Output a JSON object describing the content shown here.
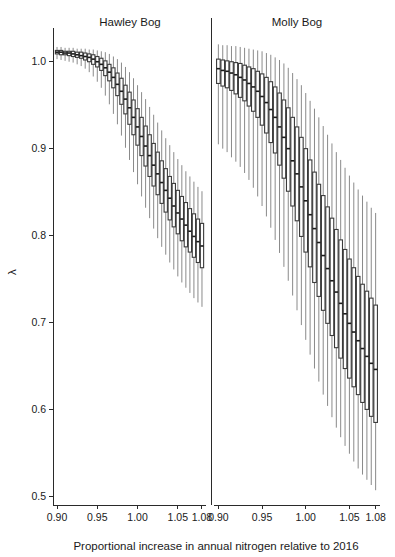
{
  "chart_data": {
    "type": "box",
    "title": "",
    "xlabel": "Proportional increase in annual nitrogen relative to 2016",
    "ylabel": "λ",
    "xlim": [
      0.895,
      1.085
    ],
    "ylim": [
      0.49,
      1.025
    ],
    "xticks": [
      0.9,
      0.95,
      1.0,
      1.05,
      1.08
    ],
    "xticklabels": [
      "0.90",
      "0.95",
      "1.00",
      "1.05",
      "1.08"
    ],
    "yticks": [
      0.5,
      0.6,
      0.7,
      0.8,
      0.9,
      1.0
    ],
    "yticklabels": [
      "0.5",
      "0.6",
      "0.7",
      "0.8",
      "0.9",
      "1.0"
    ],
    "grid": false,
    "legend": "none",
    "panels": [
      {
        "name": "Hawley Bog",
        "x": [
          0.9,
          0.905,
          0.91,
          0.915,
          0.92,
          0.925,
          0.93,
          0.935,
          0.94,
          0.945,
          0.95,
          0.955,
          0.96,
          0.965,
          0.97,
          0.975,
          0.98,
          0.985,
          0.99,
          0.995,
          1.0,
          1.005,
          1.01,
          1.015,
          1.02,
          1.025,
          1.03,
          1.035,
          1.04,
          1.045,
          1.05,
          1.055,
          1.06,
          1.065,
          1.07,
          1.075,
          1.08
        ],
        "boxes": [
          {
            "whisker_low": 1.003,
            "q1": 1.009,
            "median": 1.011,
            "q3": 1.013,
            "whisker_high": 1.017
          },
          {
            "whisker_low": 1.002,
            "q1": 1.008,
            "median": 1.011,
            "q3": 1.013,
            "whisker_high": 1.017
          },
          {
            "whisker_low": 1.001,
            "q1": 1.008,
            "median": 1.01,
            "q3": 1.012,
            "whisker_high": 1.016
          },
          {
            "whisker_low": 1.0,
            "q1": 1.007,
            "median": 1.01,
            "q3": 1.012,
            "whisker_high": 1.016
          },
          {
            "whisker_low": 0.999,
            "q1": 1.006,
            "median": 1.009,
            "q3": 1.012,
            "whisker_high": 1.016
          },
          {
            "whisker_low": 0.997,
            "q1": 1.005,
            "median": 1.008,
            "q3": 1.011,
            "whisker_high": 1.015
          },
          {
            "whisker_low": 0.995,
            "q1": 1.004,
            "median": 1.007,
            "q3": 1.011,
            "whisker_high": 1.015
          },
          {
            "whisker_low": 0.992,
            "q1": 1.002,
            "median": 1.006,
            "q3": 1.01,
            "whisker_high": 1.015
          },
          {
            "whisker_low": 0.988,
            "q1": 1.0,
            "median": 1.005,
            "q3": 1.009,
            "whisker_high": 1.014
          },
          {
            "whisker_low": 0.983,
            "q1": 0.997,
            "median": 1.003,
            "q3": 1.008,
            "whisker_high": 1.014
          },
          {
            "whisker_low": 0.977,
            "q1": 0.994,
            "median": 1.0,
            "q3": 1.006,
            "whisker_high": 1.013
          },
          {
            "whisker_low": 0.97,
            "q1": 0.99,
            "median": 0.997,
            "q3": 1.004,
            "whisker_high": 1.012
          },
          {
            "whisker_low": 0.961,
            "q1": 0.984,
            "median": 0.993,
            "q3": 1.001,
            "whisker_high": 1.011
          },
          {
            "whisker_low": 0.951,
            "q1": 0.978,
            "median": 0.988,
            "q3": 0.997,
            "whisker_high": 1.009
          },
          {
            "whisker_low": 0.94,
            "q1": 0.97,
            "median": 0.982,
            "q3": 0.993,
            "whisker_high": 1.006
          },
          {
            "whisker_low": 0.928,
            "q1": 0.961,
            "median": 0.974,
            "q3": 0.987,
            "whisker_high": 1.003
          },
          {
            "whisker_low": 0.915,
            "q1": 0.951,
            "median": 0.966,
            "q3": 0.981,
            "whisker_high": 0.999
          },
          {
            "whisker_low": 0.901,
            "q1": 0.94,
            "median": 0.957,
            "q3": 0.973,
            "whisker_high": 0.994
          },
          {
            "whisker_low": 0.887,
            "q1": 0.928,
            "median": 0.947,
            "q3": 0.965,
            "whisker_high": 0.988
          },
          {
            "whisker_low": 0.873,
            "q1": 0.916,
            "median": 0.936,
            "q3": 0.956,
            "whisker_high": 0.981
          },
          {
            "whisker_low": 0.859,
            "q1": 0.904,
            "median": 0.925,
            "q3": 0.946,
            "whisker_high": 0.973
          },
          {
            "whisker_low": 0.845,
            "q1": 0.892,
            "median": 0.914,
            "q3": 0.936,
            "whisker_high": 0.965
          },
          {
            "whisker_low": 0.832,
            "q1": 0.88,
            "median": 0.903,
            "q3": 0.926,
            "whisker_high": 0.957
          },
          {
            "whisker_low": 0.82,
            "q1": 0.868,
            "median": 0.892,
            "q3": 0.916,
            "whisker_high": 0.948
          },
          {
            "whisker_low": 0.808,
            "q1": 0.857,
            "median": 0.881,
            "q3": 0.906,
            "whisker_high": 0.939
          },
          {
            "whisker_low": 0.797,
            "q1": 0.847,
            "median": 0.871,
            "q3": 0.896,
            "whisker_high": 0.93
          },
          {
            "whisker_low": 0.787,
            "q1": 0.837,
            "median": 0.861,
            "q3": 0.886,
            "whisker_high": 0.921
          },
          {
            "whisker_low": 0.778,
            "q1": 0.827,
            "median": 0.852,
            "q3": 0.877,
            "whisker_high": 0.912
          },
          {
            "whisker_low": 0.769,
            "q1": 0.818,
            "median": 0.843,
            "q3": 0.868,
            "whisker_high": 0.904
          },
          {
            "whisker_low": 0.761,
            "q1": 0.81,
            "median": 0.834,
            "q3": 0.86,
            "whisker_high": 0.896
          },
          {
            "whisker_low": 0.753,
            "q1": 0.802,
            "median": 0.826,
            "q3": 0.852,
            "whisker_high": 0.888
          },
          {
            "whisker_low": 0.746,
            "q1": 0.794,
            "median": 0.819,
            "q3": 0.845,
            "whisker_high": 0.881
          },
          {
            "whisker_low": 0.74,
            "q1": 0.787,
            "median": 0.812,
            "q3": 0.838,
            "whisker_high": 0.874
          },
          {
            "whisker_low": 0.734,
            "q1": 0.781,
            "median": 0.805,
            "q3": 0.831,
            "whisker_high": 0.868
          },
          {
            "whisker_low": 0.728,
            "q1": 0.775,
            "median": 0.799,
            "q3": 0.825,
            "whisker_high": 0.862
          },
          {
            "whisker_low": 0.723,
            "q1": 0.769,
            "median": 0.793,
            "q3": 0.819,
            "whisker_high": 0.856
          },
          {
            "whisker_low": 0.718,
            "q1": 0.763,
            "median": 0.788,
            "q3": 0.814,
            "whisker_high": 0.851
          }
        ]
      },
      {
        "name": "Molly Bog",
        "x": [
          0.9,
          0.905,
          0.91,
          0.915,
          0.92,
          0.925,
          0.93,
          0.935,
          0.94,
          0.945,
          0.95,
          0.955,
          0.96,
          0.965,
          0.97,
          0.975,
          0.98,
          0.985,
          0.99,
          0.995,
          1.0,
          1.005,
          1.01,
          1.015,
          1.02,
          1.025,
          1.03,
          1.035,
          1.04,
          1.045,
          1.05,
          1.055,
          1.06,
          1.065,
          1.07,
          1.075,
          1.08
        ],
        "boxes": [
          {
            "whisker_low": 0.905,
            "q1": 0.975,
            "median": 0.992,
            "q3": 1.003,
            "whisker_high": 1.02
          },
          {
            "whisker_low": 0.9,
            "q1": 0.972,
            "median": 0.99,
            "q3": 1.002,
            "whisker_high": 1.019
          },
          {
            "whisker_low": 0.896,
            "q1": 0.97,
            "median": 0.989,
            "q3": 1.001,
            "whisker_high": 1.019
          },
          {
            "whisker_low": 0.89,
            "q1": 0.967,
            "median": 0.987,
            "q3": 1.0,
            "whisker_high": 1.018
          },
          {
            "whisker_low": 0.885,
            "q1": 0.963,
            "median": 0.985,
            "q3": 0.999,
            "whisker_high": 1.018
          },
          {
            "whisker_low": 0.879,
            "q1": 0.959,
            "median": 0.982,
            "q3": 0.998,
            "whisker_high": 1.017
          },
          {
            "whisker_low": 0.872,
            "q1": 0.955,
            "median": 0.979,
            "q3": 0.996,
            "whisker_high": 1.016
          },
          {
            "whisker_low": 0.864,
            "q1": 0.949,
            "median": 0.975,
            "q3": 0.994,
            "whisker_high": 1.015
          },
          {
            "whisker_low": 0.855,
            "q1": 0.943,
            "median": 0.971,
            "q3": 0.992,
            "whisker_high": 1.014
          },
          {
            "whisker_low": 0.845,
            "q1": 0.936,
            "median": 0.966,
            "q3": 0.989,
            "whisker_high": 1.013
          },
          {
            "whisker_low": 0.834,
            "q1": 0.927,
            "median": 0.96,
            "q3": 0.986,
            "whisker_high": 1.012
          },
          {
            "whisker_low": 0.822,
            "q1": 0.918,
            "median": 0.953,
            "q3": 0.982,
            "whisker_high": 1.01
          },
          {
            "whisker_low": 0.809,
            "q1": 0.907,
            "median": 0.945,
            "q3": 0.977,
            "whisker_high": 1.008
          },
          {
            "whisker_low": 0.795,
            "q1": 0.895,
            "median": 0.936,
            "q3": 0.971,
            "whisker_high": 1.005
          },
          {
            "whisker_low": 0.78,
            "q1": 0.881,
            "median": 0.925,
            "q3": 0.964,
            "whisker_high": 1.002
          },
          {
            "whisker_low": 0.764,
            "q1": 0.866,
            "median": 0.913,
            "q3": 0.956,
            "whisker_high": 0.998
          },
          {
            "whisker_low": 0.748,
            "q1": 0.851,
            "median": 0.9,
            "q3": 0.947,
            "whisker_high": 0.993
          },
          {
            "whisker_low": 0.731,
            "q1": 0.834,
            "median": 0.886,
            "q3": 0.936,
            "whisker_high": 0.987
          },
          {
            "whisker_low": 0.714,
            "q1": 0.817,
            "median": 0.871,
            "q3": 0.925,
            "whisker_high": 0.98
          },
          {
            "whisker_low": 0.697,
            "q1": 0.799,
            "median": 0.856,
            "q3": 0.913,
            "whisker_high": 0.973
          },
          {
            "whisker_low": 0.68,
            "q1": 0.781,
            "median": 0.84,
            "q3": 0.9,
            "whisker_high": 0.964
          },
          {
            "whisker_low": 0.663,
            "q1": 0.764,
            "median": 0.824,
            "q3": 0.887,
            "whisker_high": 0.955
          },
          {
            "whisker_low": 0.647,
            "q1": 0.746,
            "median": 0.808,
            "q3": 0.873,
            "whisker_high": 0.946
          },
          {
            "whisker_low": 0.632,
            "q1": 0.73,
            "median": 0.792,
            "q3": 0.859,
            "whisker_high": 0.936
          },
          {
            "whisker_low": 0.617,
            "q1": 0.714,
            "median": 0.777,
            "q3": 0.846,
            "whisker_high": 0.926
          },
          {
            "whisker_low": 0.604,
            "q1": 0.699,
            "median": 0.762,
            "q3": 0.833,
            "whisker_high": 0.916
          },
          {
            "whisker_low": 0.591,
            "q1": 0.685,
            "median": 0.748,
            "q3": 0.82,
            "whisker_high": 0.906
          },
          {
            "whisker_low": 0.579,
            "q1": 0.671,
            "median": 0.735,
            "q3": 0.807,
            "whisker_high": 0.896
          },
          {
            "whisker_low": 0.568,
            "q1": 0.659,
            "median": 0.722,
            "q3": 0.795,
            "whisker_high": 0.887
          },
          {
            "whisker_low": 0.558,
            "q1": 0.647,
            "median": 0.71,
            "q3": 0.784,
            "whisker_high": 0.878
          },
          {
            "whisker_low": 0.549,
            "q1": 0.636,
            "median": 0.699,
            "q3": 0.773,
            "whisker_high": 0.869
          },
          {
            "whisker_low": 0.54,
            "q1": 0.626,
            "median": 0.689,
            "q3": 0.763,
            "whisker_high": 0.861
          },
          {
            "whisker_low": 0.532,
            "q1": 0.617,
            "median": 0.679,
            "q3": 0.753,
            "whisker_high": 0.853
          },
          {
            "whisker_low": 0.525,
            "q1": 0.608,
            "median": 0.67,
            "q3": 0.744,
            "whisker_high": 0.846
          },
          {
            "whisker_low": 0.519,
            "q1": 0.6,
            "median": 0.661,
            "q3": 0.736,
            "whisker_high": 0.839
          },
          {
            "whisker_low": 0.513,
            "q1": 0.592,
            "median": 0.653,
            "q3": 0.728,
            "whisker_high": 0.832
          },
          {
            "whisker_low": 0.507,
            "q1": 0.585,
            "median": 0.646,
            "q3": 0.72,
            "whisker_high": 0.826
          }
        ]
      }
    ]
  },
  "layout": {
    "panel1": {
      "left": 53,
      "right": 206,
      "title_x": 130,
      "title_y": 26
    },
    "panel2": {
      "left": 214,
      "right": 380,
      "title_x": 297,
      "title_y": 26
    },
    "plot_top": 40,
    "plot_bottom": 505,
    "divider_x": 211,
    "xlabel_x": 216,
    "xlabel_y": 550,
    "ylabel_x": 16,
    "ylabel_y": 272
  },
  "colors": {
    "background": "#ffffff",
    "axis": "#2a2a2a",
    "box_stroke": "#3a3a3a",
    "median": "#1a1a1a",
    "whisker": "#8a8a8a",
    "text": "#1a1a1a"
  }
}
